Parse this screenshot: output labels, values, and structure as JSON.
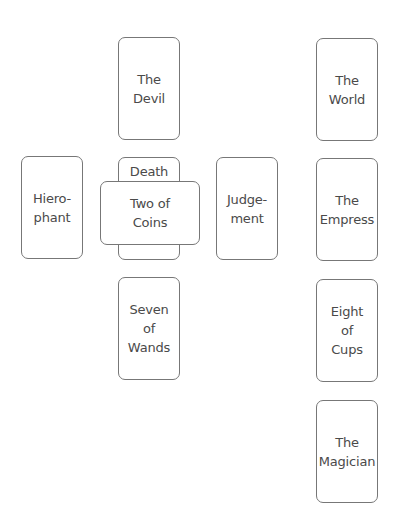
{
  "spread": {
    "cards": [
      {
        "id": "the-devil",
        "label": "The\nDevil",
        "orientation": "upright"
      },
      {
        "id": "hierophant",
        "label": "Hiero-\nphant",
        "orientation": "upright"
      },
      {
        "id": "death",
        "label": "Death",
        "orientation": "upright"
      },
      {
        "id": "two-of-coins",
        "label": "Two of\nCoins",
        "orientation": "crossing"
      },
      {
        "id": "judgement",
        "label": "Judge-\nment",
        "orientation": "upright"
      },
      {
        "id": "seven-of-wands",
        "label": "Seven\nof\nWands",
        "orientation": "upright"
      },
      {
        "id": "the-world",
        "label": "The\nWorld",
        "orientation": "upright"
      },
      {
        "id": "the-empress",
        "label": "The\nEmpress",
        "orientation": "upright"
      },
      {
        "id": "eight-of-cups",
        "label": "Eight\nof\nCups",
        "orientation": "upright"
      },
      {
        "id": "the-magician",
        "label": "The\nMagician",
        "orientation": "upright"
      }
    ]
  },
  "colors": {
    "background": "#ffffff",
    "card_border": "#777777",
    "card_text": "#4a4a4a"
  }
}
